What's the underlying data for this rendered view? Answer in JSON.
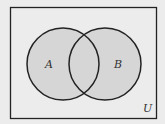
{
  "diagram": {
    "type": "venn",
    "universe_label": "U",
    "sets": [
      {
        "label": "A",
        "cx": 63,
        "cy": 64,
        "r": 36
      },
      {
        "label": "B",
        "cx": 105,
        "cy": 64,
        "r": 36
      }
    ],
    "colors": {
      "background": "#ececec",
      "fill": "#d6d6d6",
      "stroke": "#222222"
    }
  }
}
